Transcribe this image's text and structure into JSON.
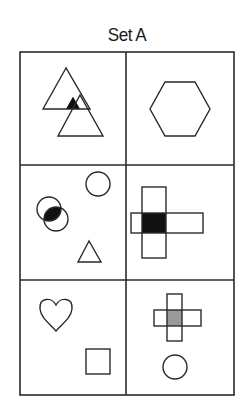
{
  "title": "Set A",
  "colors": {
    "stroke": "#2a2a2a",
    "fill_dark": "#111111",
    "fill_gray": "#9a9a9a",
    "background": "#ffffff"
  },
  "grid": {
    "rows": 3,
    "cols": 2
  },
  "cells": [
    {
      "row": 1,
      "col": 1,
      "shapes": [
        "triangle",
        "triangle",
        "black-overlap-region"
      ]
    },
    {
      "row": 1,
      "col": 2,
      "shapes": [
        "hexagon"
      ]
    },
    {
      "row": 2,
      "col": 1,
      "shapes": [
        "circle",
        "circle",
        "circle",
        "black-overlap-region",
        "triangle"
      ]
    },
    {
      "row": 2,
      "col": 2,
      "shapes": [
        "rectangle-vertical",
        "rectangle-horizontal",
        "black-overlap-square"
      ]
    },
    {
      "row": 3,
      "col": 1,
      "shapes": [
        "heart",
        "square"
      ]
    },
    {
      "row": 3,
      "col": 2,
      "shapes": [
        "rectangle-vertical",
        "rectangle-horizontal",
        "gray-overlap-square",
        "circle"
      ]
    }
  ]
}
